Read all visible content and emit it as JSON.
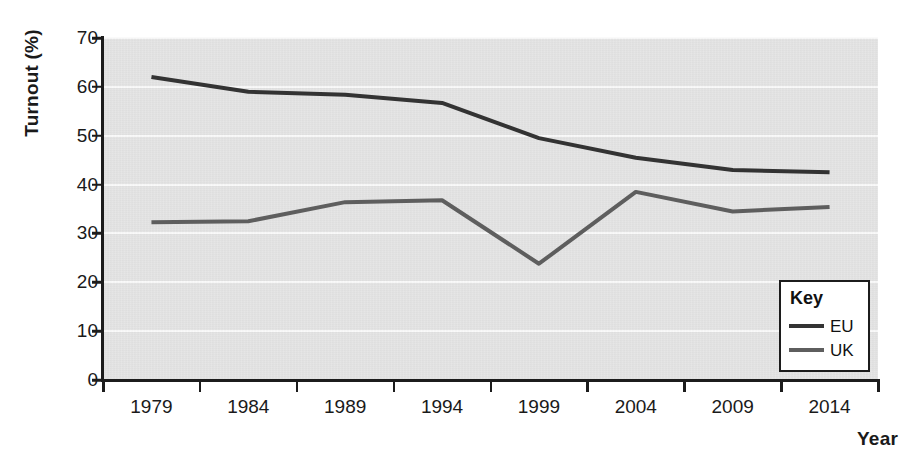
{
  "chart_data": {
    "type": "line",
    "title": "",
    "xlabel": "Year",
    "ylabel": "Turnout (%)",
    "categories": [
      "1979",
      "1984",
      "1989",
      "1994",
      "1999",
      "2004",
      "2009",
      "2014"
    ],
    "x": [
      1979,
      1984,
      1989,
      1994,
      1999,
      2004,
      2009,
      2014
    ],
    "series": [
      {
        "name": "EU",
        "color": "#333333",
        "values": [
          62.0,
          59.0,
          58.4,
          56.7,
          49.5,
          45.5,
          43.0,
          42.5
        ]
      },
      {
        "name": "UK",
        "color": "#5e5e5e",
        "values": [
          32.3,
          32.5,
          36.4,
          36.8,
          23.8,
          38.5,
          34.5,
          35.4
        ]
      }
    ],
    "ylim": [
      0,
      70
    ],
    "yticks": [
      0,
      10,
      20,
      30,
      40,
      50,
      60,
      70
    ],
    "ytick_labels": [
      "0",
      "10",
      "20",
      "30",
      "40",
      "50",
      "60",
      "70"
    ],
    "grid": "horizontal-white",
    "legend": {
      "position": "bottom-right-inside",
      "title": "Key",
      "entries": [
        "EU",
        "UK"
      ]
    },
    "plot_background": "#e4e4e4",
    "axis_color": "#1c1c1c"
  }
}
